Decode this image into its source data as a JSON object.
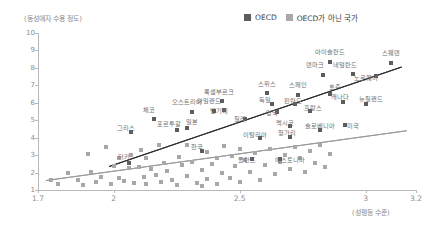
{
  "chart_data": {
    "type": "scatter",
    "title": "",
    "ylabel": "(동성애자 수용 정도)",
    "xlabel": "(성평등 수준)",
    "xlim": [
      1.7,
      3.2
    ],
    "ylim": [
      1,
      10
    ],
    "xticks": [
      "1.7",
      "2",
      "2.5",
      "3",
      "3.2"
    ],
    "xtick_values": [
      1.7,
      2,
      2.5,
      3,
      3.2
    ],
    "yticks": [
      "1",
      "2",
      "3",
      "4",
      "5",
      "6",
      "7",
      "8",
      "9",
      "10"
    ],
    "ytick_values": [
      1,
      2,
      3,
      4,
      5,
      6,
      7,
      8,
      9,
      10
    ],
    "grid": false,
    "legend_position": "top-right",
    "legend": [
      {
        "label": "OECD",
        "color": "#5d5d5d"
      },
      {
        "label": "OECD가 아닌 국가",
        "color": "#a8a8a8"
      }
    ],
    "series": [
      {
        "name": "OECD",
        "color": "#5d5d5d",
        "points": [
          {
            "label": "아이슬란드",
            "x": 2.86,
            "y": 8.35,
            "lx": 2.86,
            "ly": 8.95
          },
          {
            "label": "스웨덴",
            "x": 3.1,
            "y": 8.3,
            "lx": 3.1,
            "ly": 8.9
          },
          {
            "label": "네덜란드",
            "x": 2.95,
            "y": 7.65,
            "lx": 2.92,
            "ly": 8.25
          },
          {
            "label": "덴마크",
            "x": 2.83,
            "y": 7.6,
            "lx": 2.8,
            "ly": 8.2
          },
          {
            "label": "노르웨이",
            "x": 3.04,
            "y": 7.55,
            "lx": 3.0,
            "ly": 7.45
          },
          {
            "label": "스위스",
            "x": 2.61,
            "y": 6.55,
            "lx": 2.61,
            "ly": 7.15
          },
          {
            "label": "스페인",
            "x": 2.73,
            "y": 6.45,
            "lx": 2.73,
            "ly": 7.05
          },
          {
            "label": "호주",
            "x": 2.86,
            "y": 6.5,
            "lx": 2.88,
            "ly": 6.95
          },
          {
            "label": "룩셈부르크",
            "x": 2.43,
            "y": 6.1,
            "lx": 2.42,
            "ly": 6.7
          },
          {
            "label": "독일",
            "x": 2.63,
            "y": 5.95,
            "lx": 2.6,
            "ly": 6.2
          },
          {
            "label": "핀란드",
            "x": 2.72,
            "y": 5.95,
            "lx": 2.71,
            "ly": 6.15
          },
          {
            "label": "캐나다",
            "x": 2.91,
            "y": 6.05,
            "lx": 2.9,
            "ly": 6.4
          },
          {
            "label": "뉴질랜드",
            "x": 3.0,
            "y": 5.95,
            "lx": 3.02,
            "ly": 6.25
          },
          {
            "label": "벨기에",
            "x": 2.44,
            "y": 5.6,
            "lx": 2.42,
            "ly": 5.6
          },
          {
            "label": "프랑스",
            "x": 2.78,
            "y": 5.55,
            "lx": 2.79,
            "ly": 5.75
          },
          {
            "label": "영국",
            "x": 2.65,
            "y": 5.45,
            "lx": 2.63,
            "ly": 5.5
          },
          {
            "label": "아일랜드",
            "x": 2.4,
            "y": 5.55,
            "lx": 2.38,
            "ly": 6.15
          },
          {
            "label": "오스트리아",
            "x": 2.31,
            "y": 5.5,
            "lx": 2.29,
            "ly": 6.1
          },
          {
            "label": "체코",
            "x": 2.16,
            "y": 5.05,
            "lx": 2.14,
            "ly": 5.65
          },
          {
            "label": "칠레",
            "x": 2.52,
            "y": 5.05,
            "lx": 2.5,
            "ly": 5.15
          },
          {
            "label": "미국",
            "x": 2.92,
            "y": 4.7,
            "lx": 2.95,
            "ly": 4.75
          },
          {
            "label": "일본",
            "x": 2.29,
            "y": 4.55,
            "lx": 2.31,
            "ly": 4.95
          },
          {
            "label": "포르투갈",
            "x": 2.25,
            "y": 4.45,
            "lx": 2.22,
            "ly": 4.85
          },
          {
            "label": "그리스",
            "x": 2.07,
            "y": 4.35,
            "lx": 2.05,
            "ly": 4.6
          },
          {
            "label": "이탈리아",
            "x": 2.58,
            "y": 4.0,
            "lx": 2.56,
            "ly": 4.2
          },
          {
            "label": "헝가리",
            "x": 2.7,
            "y": 4.05,
            "lx": 2.69,
            "ly": 4.35
          },
          {
            "label": "멕시코",
            "x": 2.7,
            "y": 4.65,
            "lx": 2.68,
            "ly": 4.9
          },
          {
            "label": "슬로베니아",
            "x": 2.82,
            "y": 4.45,
            "lx": 2.82,
            "ly": 4.7
          },
          {
            "label": "한국",
            "x": 2.35,
            "y": 3.25,
            "lx": 2.33,
            "ly": 3.55
          },
          {
            "label": "폴란드",
            "x": 2.55,
            "y": 2.75,
            "lx": 2.53,
            "ly": 2.8
          },
          {
            "label": "에스토니아",
            "x": 2.66,
            "y": 2.75,
            "lx": 2.7,
            "ly": 2.8
          },
          {
            "label": "터키",
            "x": 2.06,
            "y": 2.55,
            "lx": 2.04,
            "ly": 2.95
          }
        ]
      },
      {
        "name": "OECD가 아닌 국가",
        "color": "#a8a8a8",
        "points": [
          {
            "x": 1.75,
            "y": 1.55
          },
          {
            "x": 1.78,
            "y": 1.35
          },
          {
            "x": 1.82,
            "y": 1.95
          },
          {
            "x": 1.86,
            "y": 1.6
          },
          {
            "x": 1.88,
            "y": 1.3
          },
          {
            "x": 1.91,
            "y": 2.05
          },
          {
            "x": 1.93,
            "y": 1.45
          },
          {
            "x": 1.95,
            "y": 1.75
          },
          {
            "x": 1.97,
            "y": 3.45
          },
          {
            "x": 1.99,
            "y": 1.35
          },
          {
            "x": 2.0,
            "y": 2.35
          },
          {
            "x": 2.02,
            "y": 1.7
          },
          {
            "x": 2.04,
            "y": 1.5
          },
          {
            "x": 2.06,
            "y": 2.25
          },
          {
            "x": 2.08,
            "y": 1.4
          },
          {
            "x": 2.1,
            "y": 2.3
          },
          {
            "x": 2.12,
            "y": 1.75
          },
          {
            "x": 2.13,
            "y": 1.35
          },
          {
            "x": 2.15,
            "y": 2.2
          },
          {
            "x": 2.17,
            "y": 1.85
          },
          {
            "x": 2.19,
            "y": 1.45
          },
          {
            "x": 2.21,
            "y": 2.1
          },
          {
            "x": 2.23,
            "y": 1.55
          },
          {
            "x": 2.25,
            "y": 1.3
          },
          {
            "x": 2.27,
            "y": 2.45
          },
          {
            "x": 2.29,
            "y": 1.8
          },
          {
            "x": 2.31,
            "y": 2.6
          },
          {
            "x": 2.33,
            "y": 1.4
          },
          {
            "x": 2.35,
            "y": 2.15
          },
          {
            "x": 2.37,
            "y": 1.65
          },
          {
            "x": 2.39,
            "y": 2.5
          },
          {
            "x": 2.41,
            "y": 1.35
          },
          {
            "x": 2.43,
            "y": 2.0
          },
          {
            "x": 2.44,
            "y": 3.55
          },
          {
            "x": 2.46,
            "y": 1.7
          },
          {
            "x": 2.48,
            "y": 2.35
          },
          {
            "x": 2.5,
            "y": 1.45
          },
          {
            "x": 2.52,
            "y": 2.7
          },
          {
            "x": 2.54,
            "y": 2.05
          },
          {
            "x": 2.56,
            "y": 3.1
          },
          {
            "x": 2.58,
            "y": 1.55
          },
          {
            "x": 2.6,
            "y": 2.45
          },
          {
            "x": 2.62,
            "y": 3.35
          },
          {
            "x": 2.64,
            "y": 1.9
          },
          {
            "x": 2.66,
            "y": 2.6
          },
          {
            "x": 2.68,
            "y": 3.0
          },
          {
            "x": 2.7,
            "y": 2.2
          },
          {
            "x": 2.72,
            "y": 3.45
          },
          {
            "x": 2.74,
            "y": 2.85
          },
          {
            "x": 2.76,
            "y": 2.05
          },
          {
            "x": 2.78,
            "y": 3.25
          },
          {
            "x": 2.8,
            "y": 2.55
          },
          {
            "x": 2.82,
            "y": 3.6
          },
          {
            "x": 2.84,
            "y": 2.3
          },
          {
            "x": 2.86,
            "y": 3.05
          },
          {
            "x": 2.29,
            "y": 3.6
          },
          {
            "x": 2.35,
            "y": 1.25
          },
          {
            "x": 2.18,
            "y": 3.6
          },
          {
            "x": 2.11,
            "y": 3.3
          },
          {
            "x": 1.9,
            "y": 3.05
          },
          {
            "x": 2.47,
            "y": 2.95
          },
          {
            "x": 2.5,
            "y": 3.35
          },
          {
            "x": 2.41,
            "y": 2.85
          },
          {
            "x": 2.26,
            "y": 2.9
          },
          {
            "x": 2.2,
            "y": 2.55
          },
          {
            "x": 2.02,
            "y": 2.85
          },
          {
            "x": 2.13,
            "y": 2.85
          },
          {
            "x": 2.07,
            "y": 3.0
          },
          {
            "x": 2.37,
            "y": 3.2
          }
        ]
      }
    ],
    "trendlines": [
      {
        "name": "oecd-trend",
        "color": "#2e2e2e",
        "x0": 1.98,
        "y0": 2.35,
        "x1": 3.14,
        "y1": 8.05
      },
      {
        "name": "non-oecd-trend",
        "color": "#9a9a9a",
        "x0": 1.73,
        "y0": 1.55,
        "x1": 3.16,
        "y1": 4.4
      }
    ]
  }
}
